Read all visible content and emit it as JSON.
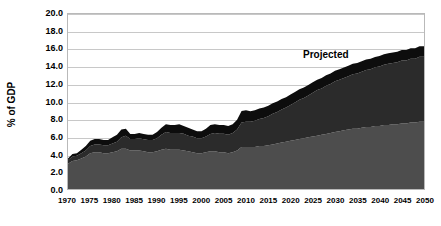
{
  "chart_data": {
    "type": "area",
    "stacked": true,
    "title": "",
    "subtitle": "",
    "xlabel": "",
    "ylabel": "% of GDP",
    "ylim": [
      0.0,
      20.0
    ],
    "xlim": [
      1970,
      2050
    ],
    "ytick_labels": [
      "20.0",
      "18.0",
      "16.0",
      "14.0",
      "12.0",
      "10.0",
      "8.0",
      "6.0",
      "4.0",
      "2.0",
      "0.0"
    ],
    "ytick_values": [
      20.0,
      18.0,
      16.0,
      14.0,
      12.0,
      10.0,
      8.0,
      6.0,
      4.0,
      2.0,
      0.0
    ],
    "xtick_labels": [
      "1970",
      "1975",
      "1980",
      "1985",
      "1990",
      "1995",
      "2000",
      "2005",
      "2010",
      "2015",
      "2020",
      "2025",
      "2030",
      "2035",
      "2040",
      "2045",
      "2050"
    ],
    "xtick_values": [
      1970,
      1975,
      1980,
      1985,
      1990,
      1995,
      2000,
      2005,
      2010,
      2015,
      2020,
      2025,
      2030,
      2035,
      2040,
      2045,
      2050
    ],
    "grid": "horizontal",
    "legend": "none",
    "annotations": [
      {
        "text": "Projected",
        "x": 2029,
        "y": 15.3
      }
    ],
    "x": [
      1970,
      1971,
      1972,
      1973,
      1974,
      1975,
      1976,
      1977,
      1978,
      1979,
      1980,
      1981,
      1982,
      1983,
      1984,
      1985,
      1986,
      1987,
      1988,
      1989,
      1990,
      1991,
      1992,
      1993,
      1994,
      1995,
      1996,
      1997,
      1998,
      1999,
      2000,
      2001,
      2002,
      2003,
      2004,
      2005,
      2006,
      2007,
      2008,
      2009,
      2010,
      2011,
      2012,
      2013,
      2014,
      2015,
      2016,
      2017,
      2018,
      2019,
      2020,
      2021,
      2022,
      2023,
      2024,
      2025,
      2026,
      2027,
      2028,
      2029,
      2030,
      2031,
      2032,
      2033,
      2034,
      2035,
      2036,
      2037,
      2038,
      2039,
      2040,
      2041,
      2042,
      2043,
      2044,
      2045,
      2046,
      2047,
      2048,
      2049,
      2050
    ],
    "series": [
      {
        "name": "lower-band",
        "color": "#4d4d4d",
        "values": [
          2.9,
          3.2,
          3.3,
          3.5,
          3.7,
          4.1,
          4.2,
          4.2,
          4.1,
          4.1,
          4.2,
          4.3,
          4.6,
          4.6,
          4.4,
          4.4,
          4.4,
          4.3,
          4.2,
          4.2,
          4.3,
          4.5,
          4.6,
          4.5,
          4.5,
          4.5,
          4.4,
          4.3,
          4.2,
          4.1,
          4.1,
          4.2,
          4.3,
          4.3,
          4.2,
          4.2,
          4.1,
          4.2,
          4.4,
          4.8,
          4.8,
          4.8,
          4.8,
          4.9,
          4.9,
          5.0,
          5.1,
          5.2,
          5.3,
          5.4,
          5.5,
          5.6,
          5.7,
          5.8,
          5.9,
          6.0,
          6.1,
          6.2,
          6.3,
          6.4,
          6.5,
          6.6,
          6.7,
          6.8,
          6.9,
          6.9,
          7.0,
          7.1,
          7.1,
          7.2,
          7.2,
          7.3,
          7.3,
          7.4,
          7.4,
          7.5,
          7.5,
          7.6,
          7.6,
          7.7,
          7.7
        ]
      },
      {
        "name": "middle-band",
        "color": "#2b2b2b",
        "values": [
          0.4,
          0.5,
          0.5,
          0.6,
          0.7,
          0.8,
          0.9,
          0.9,
          0.9,
          0.9,
          1.0,
          1.1,
          1.3,
          1.5,
          1.3,
          1.3,
          1.4,
          1.4,
          1.4,
          1.4,
          1.5,
          1.7,
          1.9,
          1.9,
          1.9,
          1.9,
          1.9,
          1.8,
          1.8,
          1.7,
          1.7,
          1.8,
          2.0,
          2.1,
          2.1,
          2.1,
          2.1,
          2.2,
          2.4,
          2.8,
          2.9,
          2.9,
          3.0,
          3.1,
          3.2,
          3.3,
          3.5,
          3.6,
          3.8,
          3.9,
          4.1,
          4.3,
          4.5,
          4.6,
          4.8,
          5.0,
          5.2,
          5.3,
          5.5,
          5.6,
          5.8,
          5.9,
          6.0,
          6.1,
          6.2,
          6.3,
          6.4,
          6.5,
          6.6,
          6.7,
          6.8,
          6.9,
          7.0,
          7.0,
          7.1,
          7.2,
          7.2,
          7.3,
          7.3,
          7.4,
          7.4
        ]
      },
      {
        "name": "upper-band",
        "color": "#0d0d0d",
        "values": [
          0.2,
          0.3,
          0.3,
          0.4,
          0.5,
          0.6,
          0.6,
          0.6,
          0.6,
          0.6,
          0.7,
          0.8,
          0.9,
          0.8,
          0.6,
          0.6,
          0.6,
          0.6,
          0.6,
          0.6,
          0.7,
          0.8,
          0.9,
          0.9,
          0.9,
          1.0,
          0.9,
          0.9,
          0.8,
          0.8,
          0.8,
          0.9,
          1.0,
          1.0,
          1.0,
          1.0,
          1.0,
          1.0,
          1.1,
          1.3,
          1.3,
          1.2,
          1.2,
          1.2,
          1.2,
          1.2,
          1.2,
          1.2,
          1.2,
          1.2,
          1.2,
          1.2,
          1.2,
          1.2,
          1.2,
          1.2,
          1.2,
          1.2,
          1.2,
          1.2,
          1.2,
          1.2,
          1.2,
          1.2,
          1.2,
          1.2,
          1.2,
          1.2,
          1.2,
          1.2,
          1.2,
          1.2,
          1.2,
          1.2,
          1.2,
          1.2,
          1.2,
          1.2,
          1.2,
          1.2,
          1.2
        ]
      }
    ]
  }
}
